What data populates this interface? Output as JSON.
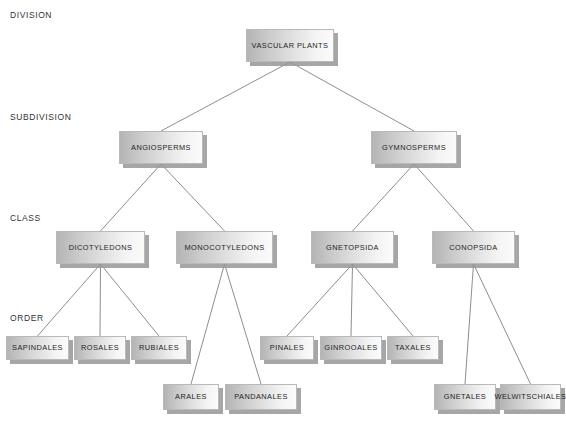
{
  "diagram": {
    "background_color": "#ffffff",
    "line_color": "#808080",
    "node_border_color": "#b9b9b9",
    "node_shadow_color": "#969696",
    "text_color": "#1f1f1f",
    "rank_label_color": "#333333"
  },
  "rank_labels": [
    {
      "id": "division",
      "text": "DIVISION",
      "x": 10,
      "y": 10
    },
    {
      "id": "subdivision",
      "text": "SUBDIVISION",
      "x": 10,
      "y": 112
    },
    {
      "id": "class",
      "text": "CLASS",
      "x": 10,
      "y": 213
    },
    {
      "id": "order",
      "text": "ORDER",
      "x": 10,
      "y": 313
    }
  ],
  "nodes": [
    {
      "id": "vascular-plants",
      "label": "VASCULAR PLANTS",
      "rank": "division",
      "x": 246,
      "y": 29,
      "w": 88,
      "h": 33
    },
    {
      "id": "angiosperms",
      "label": "ANGIOSPERMS",
      "rank": "subdivision",
      "x": 119,
      "y": 131,
      "w": 84,
      "h": 33
    },
    {
      "id": "gymnosperms",
      "label": "GYMNOSPERMS",
      "rank": "subdivision",
      "x": 371,
      "y": 131,
      "w": 86,
      "h": 33
    },
    {
      "id": "dicotyledons",
      "label": "DICOTYLEDONS",
      "rank": "class",
      "x": 56,
      "y": 231,
      "w": 89,
      "h": 33
    },
    {
      "id": "monocotyledons",
      "label": "MONOCOTYLEDONS",
      "rank": "class",
      "x": 176,
      "y": 231,
      "w": 97,
      "h": 33
    },
    {
      "id": "gnetopsida",
      "label": "GNETOPSIDA",
      "rank": "class",
      "x": 311,
      "y": 231,
      "w": 83,
      "h": 33
    },
    {
      "id": "conopsida",
      "label": "CONOPSIDA",
      "rank": "class",
      "x": 432,
      "y": 231,
      "w": 83,
      "h": 33
    },
    {
      "id": "sapindales",
      "label": "SAPINDALES",
      "rank": "order",
      "x": 6,
      "y": 336,
      "w": 63,
      "h": 24
    },
    {
      "id": "rosales",
      "label": "ROSALES",
      "rank": "order",
      "x": 74,
      "y": 336,
      "w": 52,
      "h": 24
    },
    {
      "id": "rubiales",
      "label": "RUBIALES",
      "rank": "order",
      "x": 131,
      "y": 336,
      "w": 56,
      "h": 24
    },
    {
      "id": "pinales",
      "label": "PINALES",
      "rank": "order",
      "x": 260,
      "y": 336,
      "w": 54,
      "h": 24
    },
    {
      "id": "ginrooales",
      "label": "GINROOALES",
      "rank": "order",
      "x": 320,
      "y": 336,
      "w": 62,
      "h": 24
    },
    {
      "id": "taxales",
      "label": "TAXALES",
      "rank": "order",
      "x": 387,
      "y": 336,
      "w": 52,
      "h": 24
    },
    {
      "id": "arales",
      "label": "ARALES",
      "rank": "order",
      "x": 163,
      "y": 384,
      "w": 56,
      "h": 26
    },
    {
      "id": "pandanales",
      "label": "PANDANALES",
      "rank": "order",
      "x": 225,
      "y": 384,
      "w": 72,
      "h": 26
    },
    {
      "id": "gnetales",
      "label": "GNETALES",
      "rank": "order",
      "x": 434,
      "y": 384,
      "w": 62,
      "h": 26
    },
    {
      "id": "welwitschiales",
      "label": "WELWITSCHIALES",
      "rank": "order",
      "x": 500,
      "y": 384,
      "w": 61,
      "h": 26
    }
  ],
  "edges": [
    {
      "id": "e1",
      "from": "vascular-plants",
      "to": "angiosperms"
    },
    {
      "id": "e2",
      "from": "vascular-plants",
      "to": "gymnosperms"
    },
    {
      "id": "e3",
      "from": "angiosperms",
      "to": "dicotyledons"
    },
    {
      "id": "e4",
      "from": "angiosperms",
      "to": "monocotyledons"
    },
    {
      "id": "e5",
      "from": "gymnosperms",
      "to": "gnetopsida"
    },
    {
      "id": "e6",
      "from": "gymnosperms",
      "to": "conopsida"
    },
    {
      "id": "e7",
      "from": "dicotyledons",
      "to": "sapindales"
    },
    {
      "id": "e8",
      "from": "dicotyledons",
      "to": "rosales"
    },
    {
      "id": "e9",
      "from": "dicotyledons",
      "to": "rubiales"
    },
    {
      "id": "e10",
      "from": "monocotyledons",
      "to": "arales"
    },
    {
      "id": "e11",
      "from": "monocotyledons",
      "to": "pandanales"
    },
    {
      "id": "e12",
      "from": "gnetopsida",
      "to": "pinales"
    },
    {
      "id": "e13",
      "from": "gnetopsida",
      "to": "ginrooales"
    },
    {
      "id": "e14",
      "from": "gnetopsida",
      "to": "taxales"
    },
    {
      "id": "e15",
      "from": "conopsida",
      "to": "gnetales"
    },
    {
      "id": "e16",
      "from": "conopsida",
      "to": "welwitschiales"
    }
  ]
}
